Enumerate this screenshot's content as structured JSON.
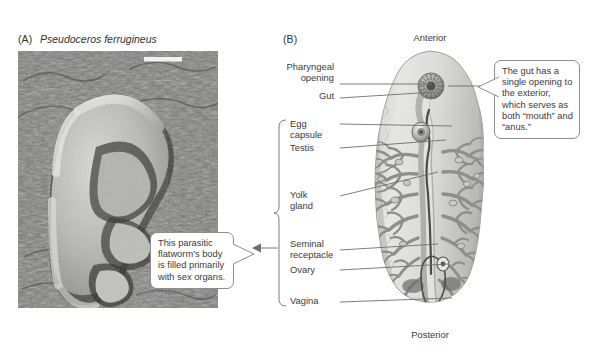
{
  "figure": {
    "panel_a": {
      "label": "(A)",
      "species": "Pseudoceros ferrugineus",
      "photo_alt": "photograph-of-flatworm",
      "callout": "This parasitic flatworm's body is filled primarily with sex organs."
    },
    "panel_b": {
      "label": "(B)",
      "orientation_top": "Anterior",
      "orientation_bottom": "Posterior",
      "callout": "The gut has a single opening to the exterior, which serves as both “mouth” and “anus.”",
      "labels": [
        {
          "id": "pharyngeal-opening",
          "text": "Pharyngeal\nopening"
        },
        {
          "id": "gut",
          "text": "Gut"
        },
        {
          "id": "egg-capsule",
          "text": "Egg\ncapsule"
        },
        {
          "id": "testis",
          "text": "Testis"
        },
        {
          "id": "yolk-gland",
          "text": "Yolk\ngland"
        },
        {
          "id": "seminal-receptacle",
          "text": "Seminal\nreceptacle"
        },
        {
          "id": "ovary",
          "text": "Ovary"
        },
        {
          "id": "vagina",
          "text": "Vagina"
        }
      ],
      "bracket_groups_labels": [
        "Egg capsule",
        "Testis",
        "Yolk gland",
        "Seminal receptacle",
        "Ovary",
        "Vagina"
      ]
    },
    "colors": {
      "text": "#3a3a3a",
      "line": "#6e6e6e",
      "callout_border": "#8d8d8d",
      "body_fill": "#d8d8d6",
      "organ_dark": "#6f6f6f",
      "background": "#ffffff"
    }
  }
}
